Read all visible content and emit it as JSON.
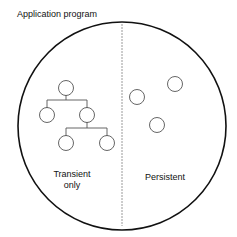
{
  "title": "Application program",
  "regions": {
    "left": {
      "label_line1": "Transient",
      "label_line2": "only"
    },
    "right": {
      "label": "Persistent"
    }
  },
  "colors": {
    "outline": "#111111",
    "node": "#555555",
    "divider": "#9a9a9a"
  }
}
